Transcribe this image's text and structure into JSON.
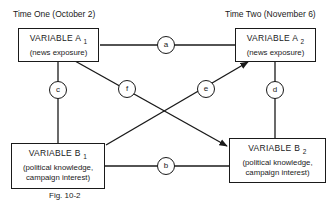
{
  "time_labels": {
    "left": "Time One (October 2)",
    "right": "Time Two (November 6)"
  },
  "boxes": {
    "a1": {
      "title": "VARIABLE A",
      "sub": "1",
      "desc_lines": [
        "(news exposure)"
      ]
    },
    "a2": {
      "title": "VARIABLE A",
      "sub": "2",
      "desc_lines": [
        "(news exposure)"
      ]
    },
    "b1": {
      "title": "VARIABLE B",
      "sub": "1",
      "desc_lines": [
        "(political knowledge,",
        "campaign interest)"
      ]
    },
    "b2": {
      "title": "VARIABLE B",
      "sub": "2",
      "desc_lines": [
        "(political knowledge,",
        "campaign interest)"
      ]
    }
  },
  "paths": {
    "a": "a",
    "b": "b",
    "c": "c",
    "d": "d",
    "e": "e",
    "f": "f"
  },
  "caption": "Fig. 10-2",
  "colors": {
    "ink": "#1a1a1a",
    "background": "#ffffff"
  }
}
